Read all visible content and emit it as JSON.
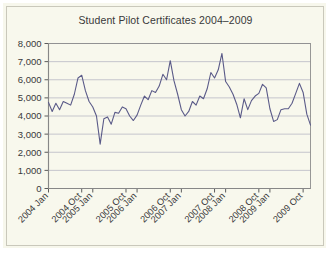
{
  "figure": {
    "background_color": "#f8f8ed",
    "panel_border_color": "#c9c8bb"
  },
  "chart_data": {
    "type": "line",
    "title": "Student Pilot Certificates 2004–2009",
    "xlabel": "",
    "ylabel": "",
    "ylim": [
      0,
      8000
    ],
    "ytick_values": [
      0,
      1000,
      2000,
      3000,
      4000,
      5000,
      6000,
      7000,
      8000
    ],
    "ytick_labels": [
      "0",
      "1,000",
      "2,000",
      "3,000",
      "4,000",
      "5,000",
      "6,000",
      "7,000",
      "8,000"
    ],
    "xtick_labels": [
      "2004 Jan",
      "2004 Oct",
      "2005 Jan",
      "2005 Oct",
      "2006 Jan",
      "2006 Oct",
      "2007 Jan",
      "2007 Oct",
      "2008 Jan",
      "2008 Oct",
      "2009 Jan",
      "2009 Oct"
    ],
    "xtick_indices": [
      0,
      9,
      12,
      21,
      24,
      33,
      36,
      45,
      48,
      57,
      60,
      69
    ],
    "grid": "horizontal",
    "grid_color": "#b9b9c4",
    "legend": "none",
    "line_color": "#5a5a88",
    "line_width": 1.1,
    "x": [
      "2004 Jan",
      "2004 Feb",
      "2004 Mar",
      "2004 Apr",
      "2004 May",
      "2004 Jun",
      "2004 Jul",
      "2004 Aug",
      "2004 Sep",
      "2004 Oct",
      "2004 Nov",
      "2004 Dec",
      "2005 Jan",
      "2005 Feb",
      "2005 Mar",
      "2005 Apr",
      "2005 May",
      "2005 Jun",
      "2005 Jul",
      "2005 Aug",
      "2005 Sep",
      "2005 Oct",
      "2005 Nov",
      "2005 Dec",
      "2006 Jan",
      "2006 Feb",
      "2006 Mar",
      "2006 Apr",
      "2006 May",
      "2006 Jun",
      "2006 Jul",
      "2006 Aug",
      "2006 Sep",
      "2006 Oct",
      "2006 Nov",
      "2006 Dec",
      "2007 Jan",
      "2007 Feb",
      "2007 Mar",
      "2007 Apr",
      "2007 May",
      "2007 Jun",
      "2007 Jul",
      "2007 Aug",
      "2007 Sep",
      "2007 Oct",
      "2007 Nov",
      "2007 Dec",
      "2008 Jan",
      "2008 Feb",
      "2008 Mar",
      "2008 Apr",
      "2008 May",
      "2008 Jun",
      "2008 Jul",
      "2008 Aug",
      "2008 Sep",
      "2008 Oct",
      "2008 Nov",
      "2008 Dec",
      "2009 Jan",
      "2009 Feb",
      "2009 Mar",
      "2009 Apr",
      "2009 May",
      "2009 Jun",
      "2009 Jul",
      "2009 Aug",
      "2009 Sep",
      "2009 Oct",
      "2009 Nov",
      "2009 Dec"
    ],
    "values": [
      4750,
      4250,
      4700,
      4350,
      4800,
      4700,
      4600,
      5200,
      6100,
      6250,
      5400,
      4800,
      4500,
      4000,
      2450,
      3850,
      3950,
      3550,
      4200,
      4150,
      4500,
      4400,
      4000,
      3750,
      4050,
      4600,
      5100,
      4900,
      5400,
      5300,
      5650,
      6300,
      6000,
      7050,
      5950,
      5200,
      4350,
      4000,
      4250,
      4800,
      4600,
      5100,
      4950,
      5500,
      6400,
      6100,
      6550,
      7450,
      5900,
      5600,
      5200,
      4650,
      3900,
      4950,
      4350,
      4850,
      5100,
      5250,
      5750,
      5550,
      4400,
      3700,
      3800,
      4350,
      4400,
      4400,
      4700,
      5250,
      5800,
      5300,
      4100,
      3500
    ]
  }
}
